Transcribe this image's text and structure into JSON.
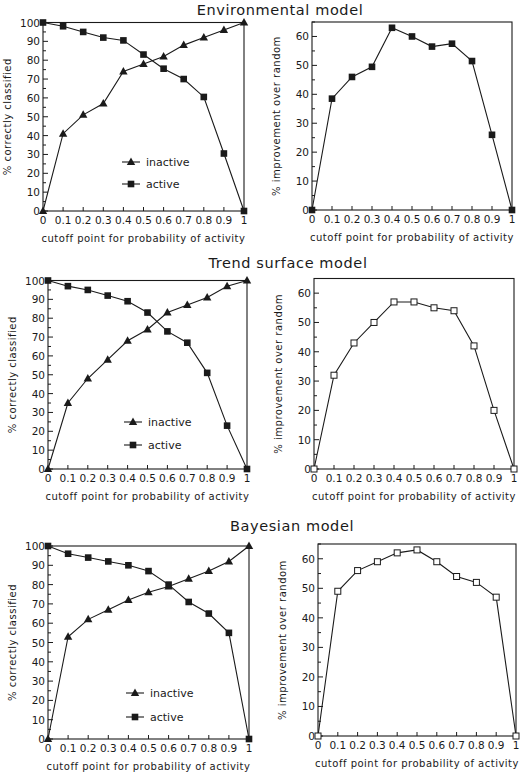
{
  "figure": {
    "width": 520,
    "height": 775,
    "colors": {
      "ink": "#1a1a1a",
      "background": "#ffffff"
    }
  },
  "sections": [
    {
      "title": "Environmental model",
      "title_x": 280,
      "title_y": 15
    },
    {
      "title": "Trend surface model",
      "title_x": 288,
      "title_y": 268
    },
    {
      "title": "Bayesian model",
      "title_x": 292,
      "title_y": 531
    }
  ],
  "chart_data": [
    {
      "id": "env-classified",
      "panel": "Environmental model",
      "type": "line",
      "frame": {
        "x0": 43,
        "x1": 244,
        "y0": 211,
        "y1": 22.5
      },
      "xlabel": "cutoff point for probability of activity",
      "ylabel": "% correctly classified",
      "x": [
        0,
        0.1,
        0.2,
        0.3,
        0.4,
        0.5,
        0.6,
        0.7,
        0.8,
        0.9,
        1
      ],
      "xtick_labels": [
        "0",
        "0.1",
        "0.2",
        "0.3",
        "0.4",
        "0.5",
        "0.6",
        "0.7",
        "0.8",
        "0.9",
        "1"
      ],
      "xlim": [
        0,
        1
      ],
      "ylim": [
        0,
        100
      ],
      "yticks": [
        0,
        10,
        20,
        30,
        40,
        50,
        60,
        70,
        80,
        90,
        100
      ],
      "minor_step": 5,
      "grid": false,
      "legend": {
        "position": "lower-center",
        "x": 122,
        "y": 162,
        "gap": 22
      },
      "series": [
        {
          "name": "inactive",
          "marker": "triangle-filled",
          "values": [
            0,
            41,
            51,
            57,
            74,
            78,
            82,
            88,
            92,
            96,
            100
          ]
        },
        {
          "name": "active",
          "marker": "square-filled",
          "values": [
            100,
            98,
            95,
            92,
            90.5,
            83,
            75.5,
            70,
            60.5,
            30.5,
            0
          ]
        }
      ]
    },
    {
      "id": "env-improvement",
      "panel": "Environmental model",
      "type": "line",
      "frame": {
        "x0": 312,
        "x1": 512,
        "y0": 210,
        "y1": 22
      },
      "xlabel": "cutoff point for probability of activity",
      "ylabel": "% improvement over random",
      "x": [
        0,
        0.1,
        0.2,
        0.3,
        0.4,
        0.5,
        0.6,
        0.7,
        0.8,
        0.9,
        1
      ],
      "xtick_labels": [
        "0",
        "0.1",
        "0.2",
        "0.3",
        "0.4",
        "0.5",
        "0.6",
        "0.7",
        "0.8",
        "0.9",
        "1"
      ],
      "xlim": [
        0,
        1
      ],
      "ylim": [
        0,
        65
      ],
      "yticks": [
        0,
        10,
        20,
        30,
        40,
        50,
        60
      ],
      "minor_step": 5,
      "grid": false,
      "legend": null,
      "series": [
        {
          "name": "improvement",
          "marker": "square-filled",
          "values": [
            0,
            38.5,
            46,
            49.5,
            63,
            60,
            56.5,
            57.5,
            51.5,
            26,
            0
          ]
        }
      ]
    },
    {
      "id": "trend-classified",
      "panel": "Trend surface model",
      "type": "line",
      "frame": {
        "x0": 48,
        "x1": 247,
        "y0": 469,
        "y1": 280.5
      },
      "xlabel": "cutoff point for probability of activity",
      "ylabel": "% correctly classified",
      "x": [
        0,
        0.1,
        0.2,
        0.3,
        0.4,
        0.5,
        0.6,
        0.7,
        0.8,
        0.9,
        1
      ],
      "xtick_labels": [
        "0",
        "0.1",
        "0.2",
        "0.3",
        "0.4",
        "0.5",
        "0.6",
        "0.7",
        "0.8",
        "0.9",
        "1"
      ],
      "xlim": [
        0,
        1
      ],
      "ylim": [
        0,
        100
      ],
      "yticks": [
        0,
        10,
        20,
        30,
        40,
        50,
        60,
        70,
        80,
        90,
        100
      ],
      "minor_step": 5,
      "grid": false,
      "legend": {
        "position": "lower-center",
        "x": 124,
        "y": 422,
        "gap": 23
      },
      "series": [
        {
          "name": "inactive",
          "marker": "triangle-filled",
          "values": [
            0,
            35,
            48,
            58,
            68,
            74,
            83,
            87,
            91,
            97,
            100
          ]
        },
        {
          "name": "active",
          "marker": "square-filled",
          "values": [
            100,
            97,
            95,
            92,
            89,
            83,
            73,
            67,
            51,
            23,
            0
          ]
        }
      ]
    },
    {
      "id": "trend-improvement",
      "panel": "Trend surface model",
      "type": "line",
      "frame": {
        "x0": 314,
        "x1": 514,
        "y0": 469,
        "y1": 278.5
      },
      "xlabel": "cutoff point for probability of activity",
      "ylabel": "% improvement over random",
      "x": [
        0,
        0.1,
        0.2,
        0.3,
        0.4,
        0.5,
        0.6,
        0.7,
        0.8,
        0.9,
        1
      ],
      "xtick_labels": [
        "0",
        "0.1",
        "0.2",
        "0.3",
        "0.4",
        "0.5",
        "0.6",
        "0.7",
        "0.8",
        "0.9",
        "1"
      ],
      "xlim": [
        0,
        1
      ],
      "ylim": [
        0,
        65
      ],
      "yticks": [
        0,
        10,
        20,
        30,
        40,
        50,
        60
      ],
      "minor_step": 5,
      "grid": false,
      "legend": null,
      "series": [
        {
          "name": "improvement",
          "marker": "square-open",
          "values": [
            0,
            32,
            43,
            50,
            57,
            57,
            55,
            54,
            42,
            20,
            0
          ]
        }
      ]
    },
    {
      "id": "bayes-classified",
      "panel": "Bayesian model",
      "type": "line",
      "frame": {
        "x0": 48,
        "x1": 249,
        "y0": 739,
        "y1": 546
      },
      "xlabel": "cutoff point for probability of activity",
      "ylabel": "% correctly classified",
      "x": [
        0,
        0.1,
        0.2,
        0.3,
        0.4,
        0.5,
        0.6,
        0.7,
        0.8,
        0.9,
        1
      ],
      "xtick_labels": [
        "0",
        "0.1",
        "0.2",
        "0.3",
        "0.4",
        "0.5",
        "0.6",
        "0.7",
        "0.8",
        "0.9",
        "1"
      ],
      "xlim": [
        0,
        1
      ],
      "ylim": [
        0,
        100
      ],
      "yticks": [
        0,
        10,
        20,
        30,
        40,
        50,
        60,
        70,
        80,
        90,
        100
      ],
      "minor_step": 5,
      "grid": false,
      "legend": {
        "position": "lower-center",
        "x": 126,
        "y": 693,
        "gap": 24
      },
      "series": [
        {
          "name": "inactive",
          "marker": "triangle-filled",
          "values": [
            0,
            53,
            62,
            67,
            72,
            76,
            79,
            83,
            87,
            92,
            100
          ]
        },
        {
          "name": "active",
          "marker": "square-filled",
          "values": [
            100,
            96,
            94,
            92,
            90,
            87,
            80,
            71,
            65,
            55,
            0
          ]
        }
      ]
    },
    {
      "id": "bayes-improvement",
      "panel": "Bayesian model",
      "type": "line",
      "frame": {
        "x0": 318,
        "x1": 516,
        "y0": 736,
        "y1": 544
      },
      "xlabel": "cutoff point for probability of activity",
      "ylabel": "% improvement over random",
      "x": [
        0,
        0.1,
        0.2,
        0.3,
        0.4,
        0.5,
        0.6,
        0.7,
        0.8,
        0.9,
        1
      ],
      "xtick_labels": [
        "0",
        "0.1",
        "0.2",
        "0.3",
        "0.4",
        "0.5",
        "0.6",
        "0.7",
        "0.8",
        "0.9",
        "1"
      ],
      "xlim": [
        0,
        1
      ],
      "ylim": [
        0,
        65
      ],
      "yticks": [
        0,
        10,
        20,
        30,
        40,
        50,
        60
      ],
      "minor_step": 5,
      "grid": false,
      "legend": null,
      "series": [
        {
          "name": "improvement",
          "marker": "square-open",
          "values": [
            0,
            49,
            56,
            59,
            62,
            63,
            59,
            54,
            52,
            47,
            0
          ]
        }
      ]
    }
  ]
}
